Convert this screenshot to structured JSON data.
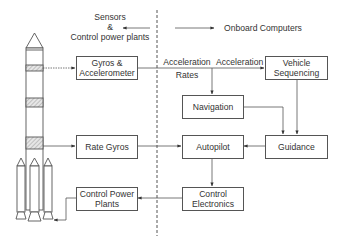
{
  "diagram": {
    "legend": {
      "left_label_line1": "Sensors",
      "left_label_line2": "&",
      "left_label_line3": "Control power plants",
      "right_label": "Onboard Computers"
    },
    "boxes": {
      "gyros_accel_line1": "Gyros &",
      "gyros_accel_line2": "Accelerometer",
      "vehicle_seq_line1": "Vehicle",
      "vehicle_seq_line2": "Sequencing",
      "navigation": "Navigation",
      "rate_gyros": "Rate Gyros",
      "autopilot": "Autopilot",
      "guidance": "Guidance",
      "control_power_line1": "Control Power",
      "control_power_line2": "Plants",
      "control_elec_line1": "Control",
      "control_elec_line2": "Electronics"
    },
    "edge_labels": {
      "acceleration_rates_line1": "Acceleration",
      "acceleration_rates_line2": "Rates",
      "acceleration": "Acceleration"
    },
    "colors": {
      "line": "#555555",
      "text": "#333333",
      "hatch": "#aaaaaa"
    }
  }
}
